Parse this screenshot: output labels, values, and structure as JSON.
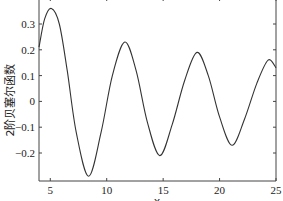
{
  "chart_data": {
    "type": "line",
    "title": "",
    "xlabel": "x",
    "ylabel": "2阶贝塞尔函数",
    "xlim": [
      4,
      25
    ],
    "ylim": [
      -0.3,
      0.39
    ],
    "xticks": [
      5,
      10,
      15,
      20,
      25
    ],
    "yticks": [
      -0.2,
      -0.1,
      0,
      0.1,
      0.2,
      0.3
    ],
    "xtick_labels": [
      "5",
      "10",
      "15",
      "20",
      "25"
    ],
    "ytick_labels": [
      "-0.2",
      "-0.1",
      "0",
      "0.1",
      "0.2",
      "0.3"
    ],
    "grid": false,
    "series": [
      {
        "name": "2阶贝塞尔函数",
        "color": "#333333",
        "x": [
          4.0,
          4.5,
          5.1,
          5.8,
          6.5,
          7.3,
          8.4,
          9.5,
          10.5,
          11.6,
          12.6,
          13.6,
          14.7,
          15.8,
          16.9,
          18.0,
          19.0,
          20.0,
          21.1,
          22.2,
          23.3,
          24.3,
          25.0
        ],
        "values": [
          0.21,
          0.32,
          0.36,
          0.3,
          0.12,
          -0.12,
          -0.29,
          -0.12,
          0.1,
          0.23,
          0.12,
          -0.08,
          -0.21,
          -0.09,
          0.08,
          0.19,
          0.1,
          -0.06,
          -0.17,
          -0.07,
          0.07,
          0.16,
          0.13
        ]
      }
    ]
  }
}
